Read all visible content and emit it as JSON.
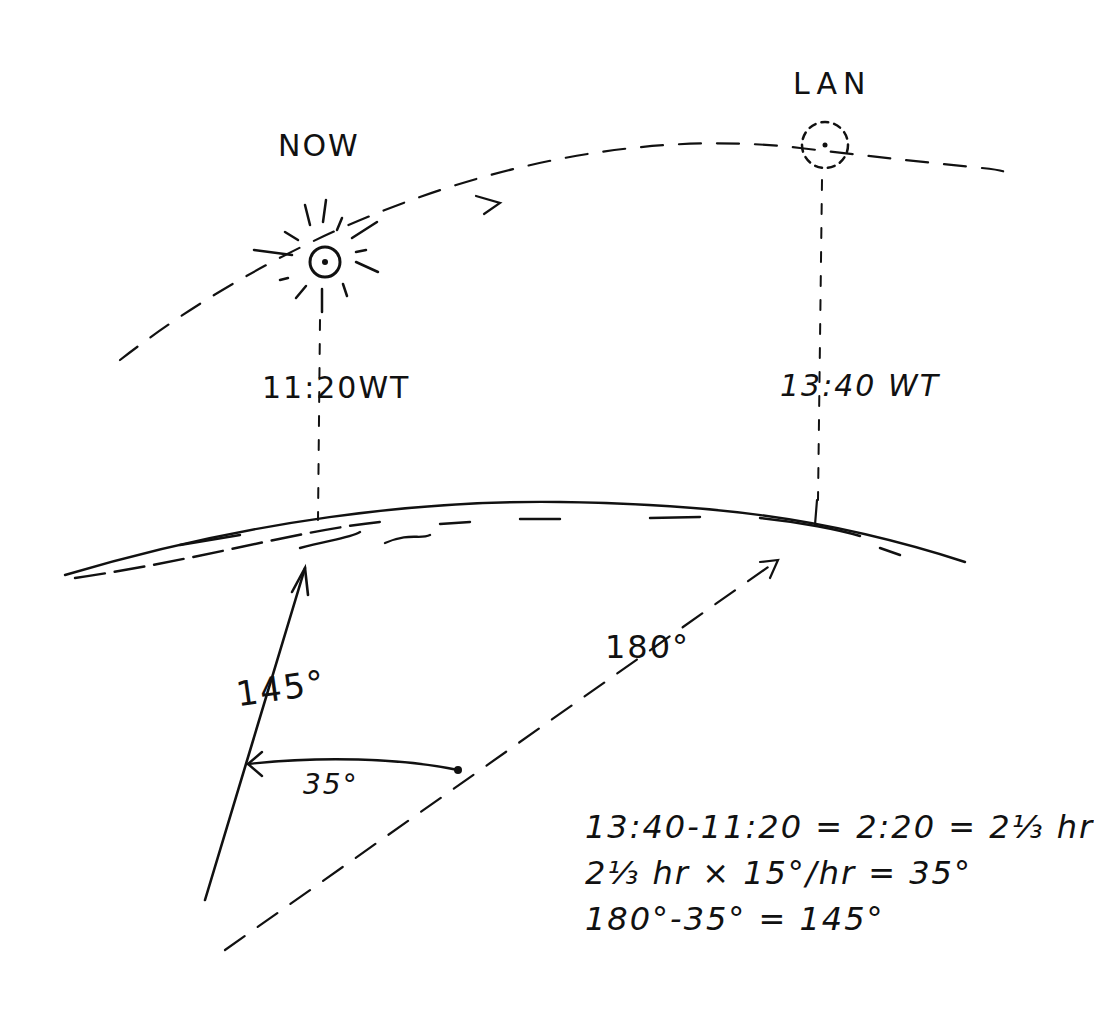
{
  "labels": {
    "now": "NOW",
    "lan": "LAN",
    "now_time": "11:20WT",
    "lan_time": "13:40 WT",
    "bearing_lan": "180°",
    "bearing_now": "145°",
    "angle_diff": "35°"
  },
  "calculations": [
    "13:40-11:20 = 2:20 = 2⅓ hr",
    "2⅓ hr × 15°/hr = 35°",
    "180°-35° = 145°"
  ],
  "colors": {
    "ink": "#111111",
    "paper": "#ffffff"
  }
}
